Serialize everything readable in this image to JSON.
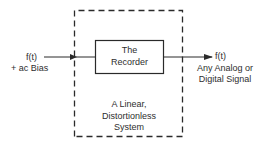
{
  "diagram": {
    "input": {
      "line1": "f(t)",
      "line2": "+ ac Bias"
    },
    "recorder_box": {
      "line1": "The",
      "line2": "Recorder"
    },
    "output": {
      "line1": "f(t)",
      "line2": "Any Analog or",
      "line3": "Digital Signal"
    },
    "system_box": {
      "line1": "A Linear,",
      "line2": "Distortionless",
      "line3": "System"
    },
    "colors": {
      "stroke": "#2a2a2a",
      "background": "#ffffff"
    }
  }
}
